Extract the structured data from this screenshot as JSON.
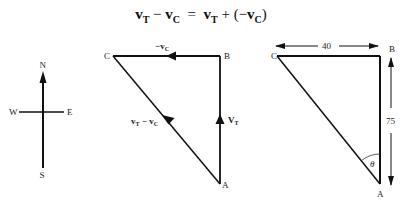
{
  "equation": {
    "lhs_a": "v",
    "lhs_a_sub": "T",
    "minus": " − ",
    "lhs_b": "v",
    "lhs_b_sub": "C",
    "equals": "  =  ",
    "rhs_a": "v",
    "rhs_a_sub": "T",
    "plus": " + (−",
    "rhs_b": "v",
    "rhs_b_sub": "C",
    "close": ")"
  },
  "compass": {
    "north": "N",
    "south": "S",
    "east": "E",
    "west": "W"
  },
  "vector_triangle": {
    "vertex_a": "A",
    "vertex_b": "B",
    "vertex_c": "C",
    "side_cb_label": "−v",
    "side_cb_sub": "C",
    "side_ab_label": "V",
    "side_ab_sub": "T",
    "side_ac_label_a": "v",
    "side_ac_sub_a": "T",
    "side_ac_minus": " − ",
    "side_ac_label_b": "v",
    "side_ac_sub_b": "C"
  },
  "dimension_triangle": {
    "vertex_a": "A",
    "vertex_b": "B",
    "vertex_c": "C",
    "width_label": "40",
    "height_label": "75",
    "angle_label": "θ"
  }
}
